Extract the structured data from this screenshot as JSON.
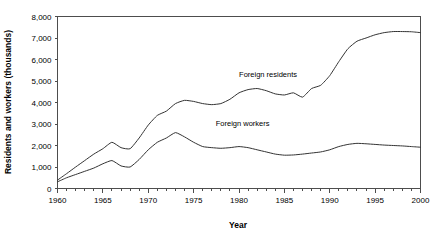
{
  "chart_data": {
    "type": "line",
    "title": "",
    "xlabel": "Year",
    "ylabel": "Residents and workers (thousands)",
    "xlim": [
      1960,
      2000
    ],
    "ylim": [
      0,
      8000
    ],
    "grid": false,
    "legend_position": "inline-annotations",
    "x_tick_labels": [
      "1960",
      "1965",
      "1970",
      "1975",
      "1980",
      "1985",
      "1990",
      "1995",
      "2000"
    ],
    "x_tick_values": [
      1960,
      1965,
      1970,
      1975,
      1980,
      1985,
      1990,
      1995,
      2000
    ],
    "x_minor_tick_interval": 1,
    "y_tick_labels": [
      "0",
      "1,000",
      "2,000",
      "3,000",
      "4,000",
      "5,000",
      "6,000",
      "7,000",
      "8,000"
    ],
    "y_tick_values": [
      0,
      1000,
      2000,
      3000,
      4000,
      5000,
      6000,
      7000,
      8000
    ],
    "x": [
      1960,
      1961,
      1962,
      1963,
      1964,
      1965,
      1966,
      1967,
      1968,
      1969,
      1970,
      1971,
      1972,
      1973,
      1974,
      1975,
      1976,
      1977,
      1978,
      1979,
      1980,
      1981,
      1982,
      1983,
      1984,
      1985,
      1986,
      1987,
      1988,
      1989,
      1990,
      1991,
      1992,
      1993,
      1994,
      1995,
      1996,
      1997,
      1998,
      1999,
      2000
    ],
    "series": [
      {
        "name": "Foreign residents",
        "color": "#333333",
        "label_text": "Foreign residents",
        "values": [
          390,
          690,
          1000,
          1300,
          1600,
          1850,
          2150,
          1900,
          1850,
          2350,
          2950,
          3400,
          3600,
          3950,
          4100,
          4050,
          3950,
          3900,
          3950,
          4150,
          4450,
          4600,
          4650,
          4550,
          4400,
          4350,
          4450,
          4250,
          4650,
          4800,
          5250,
          5900,
          6500,
          6850,
          7000,
          7150,
          7250,
          7300,
          7300,
          7290,
          7250
        ]
      },
      {
        "name": "Foreign workers",
        "color": "#333333",
        "label_text": "Foreign workers",
        "values": [
          310,
          500,
          650,
          800,
          950,
          1150,
          1300,
          1050,
          1000,
          1350,
          1800,
          2150,
          2350,
          2600,
          2400,
          2150,
          1950,
          1900,
          1870,
          1900,
          1950,
          1900,
          1800,
          1700,
          1600,
          1550,
          1560,
          1600,
          1650,
          1700,
          1800,
          1950,
          2050,
          2100,
          2080,
          2050,
          2020,
          2000,
          1980,
          1950,
          1920
        ]
      }
    ],
    "annotations": [
      {
        "text": "Foreign residents",
        "x": 1983.2,
        "y": 5180
      },
      {
        "text": "Foreign workers",
        "x": 1980.4,
        "y": 2900
      }
    ]
  }
}
